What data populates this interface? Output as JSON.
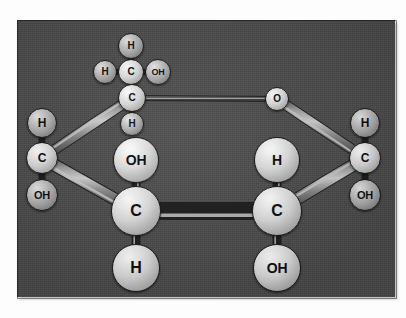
{
  "figure": {
    "panel": {
      "background_color": "#4a4a4a",
      "left": 17,
      "top": 20,
      "width": 378,
      "height": 277
    },
    "page_background_color": "#fdfdfd"
  },
  "palette": {
    "carbon_sphere": "#e0e0e0",
    "hydrogen_sphere": "#a8a8a8",
    "hydroxyl_sphere": "#dadada",
    "bond_color": "#6f6f6f",
    "bond_highlight": "#c9c9c9",
    "bond_outline": "#1c1c1c",
    "label_color": "#0b0b0b"
  },
  "atoms": [
    {
      "id": "c6",
      "label": "H",
      "kind": "mid",
      "x": 131,
      "y": 46,
      "r": 13,
      "font": 10
    },
    {
      "id": "c6h_l",
      "label": "H",
      "kind": "mid",
      "x": 105,
      "y": 72,
      "r": 12,
      "font": 10
    },
    {
      "id": "c6c",
      "label": "C",
      "kind": "light",
      "x": 131,
      "y": 72,
      "r": 13,
      "font": 10
    },
    {
      "id": "c6oh",
      "label": "OH",
      "kind": "mid",
      "x": 158,
      "y": 72,
      "r": 13,
      "font": 9
    },
    {
      "id": "c5",
      "label": "C",
      "kind": "light",
      "x": 132,
      "y": 98,
      "r": 14,
      "font": 10
    },
    {
      "id": "c5h",
      "label": "H",
      "kind": "mid",
      "x": 132,
      "y": 124,
      "r": 12,
      "font": 10
    },
    {
      "id": "o5",
      "label": "O",
      "kind": "light",
      "x": 277,
      "y": 99,
      "r": 12,
      "font": 10
    },
    {
      "id": "c4h",
      "label": "H",
      "kind": "mid",
      "x": 42,
      "y": 123,
      "r": 15,
      "font": 12
    },
    {
      "id": "c4",
      "label": "C",
      "kind": "light",
      "x": 42,
      "y": 158,
      "r": 16,
      "font": 12
    },
    {
      "id": "c4oh",
      "label": "OH",
      "kind": "mid",
      "x": 42,
      "y": 195,
      "r": 16,
      "font": 11
    },
    {
      "id": "c1h",
      "label": "H",
      "kind": "mid",
      "x": 365,
      "y": 123,
      "r": 15,
      "font": 12
    },
    {
      "id": "c1",
      "label": "C",
      "kind": "light",
      "x": 365,
      "y": 158,
      "r": 16,
      "font": 12
    },
    {
      "id": "c1oh",
      "label": "OH",
      "kind": "mid",
      "x": 365,
      "y": 195,
      "r": 16,
      "font": 11
    },
    {
      "id": "c3oh",
      "label": "OH",
      "kind": "front",
      "x": 136,
      "y": 160,
      "r": 23,
      "font": 14
    },
    {
      "id": "c3",
      "label": "C",
      "kind": "front",
      "x": 136,
      "y": 211,
      "r": 25,
      "font": 16
    },
    {
      "id": "c3h",
      "label": "H",
      "kind": "front",
      "x": 136,
      "y": 268,
      "r": 24,
      "font": 16
    },
    {
      "id": "c2h",
      "label": "H",
      "kind": "front",
      "x": 277,
      "y": 160,
      "r": 23,
      "font": 14
    },
    {
      "id": "c2",
      "label": "C",
      "kind": "front",
      "x": 277,
      "y": 211,
      "r": 25,
      "font": 16
    },
    {
      "id": "c2oh",
      "label": "OH",
      "kind": "front",
      "x": 277,
      "y": 268,
      "r": 24,
      "font": 14
    }
  ],
  "bonds": [
    {
      "id": "b-c6-h",
      "from": "c6c",
      "to": "c6",
      "width": 4,
      "style": "thin"
    },
    {
      "id": "b-c6-hl",
      "from": "c6c",
      "to": "c6h_l",
      "width": 4,
      "style": "thin"
    },
    {
      "id": "b-c6-oh",
      "from": "c6c",
      "to": "c6oh",
      "width": 4,
      "style": "thin"
    },
    {
      "id": "b-c6-c5",
      "from": "c6c",
      "to": "c5",
      "width": 5,
      "style": "thin"
    },
    {
      "id": "b-c5-h",
      "from": "c5",
      "to": "c5h",
      "width": 4,
      "style": "thin"
    },
    {
      "id": "b-c5-o5",
      "from": "c5",
      "to": "o5",
      "width": 4,
      "style": "thin"
    },
    {
      "id": "b-c5-c4",
      "from": "c5",
      "to": "c4",
      "width": 9,
      "style": "thick"
    },
    {
      "id": "b-c4-h",
      "from": "c4",
      "to": "c4h",
      "width": 5,
      "style": "thin"
    },
    {
      "id": "b-c4-oh",
      "from": "c4",
      "to": "c4oh",
      "width": 5,
      "style": "thin"
    },
    {
      "id": "b-c4-c3",
      "from": "c4",
      "to": "c3",
      "width": 11,
      "style": "thick"
    },
    {
      "id": "b-o5-c1",
      "from": "o5",
      "to": "c1",
      "width": 9,
      "style": "thick"
    },
    {
      "id": "b-c1-h",
      "from": "c1",
      "to": "c1h",
      "width": 5,
      "style": "thin"
    },
    {
      "id": "b-c1-oh",
      "from": "c1",
      "to": "c1oh",
      "width": 5,
      "style": "thin"
    },
    {
      "id": "b-c1-c2",
      "from": "c1",
      "to": "c2",
      "width": 11,
      "style": "thick"
    },
    {
      "id": "b-c3-oh",
      "from": "c3",
      "to": "c3oh",
      "width": 7,
      "style": "thin"
    },
    {
      "id": "b-c3-h",
      "from": "c3",
      "to": "c3h",
      "width": 7,
      "style": "thin"
    },
    {
      "id": "b-c2-h",
      "from": "c2",
      "to": "c2h",
      "width": 7,
      "style": "thin"
    },
    {
      "id": "b-c2-oh",
      "from": "c2",
      "to": "c2oh",
      "width": 7,
      "style": "thin"
    },
    {
      "id": "b-c3-c2",
      "from": "c3",
      "to": "c2",
      "width": 16,
      "style": "thick"
    }
  ]
}
